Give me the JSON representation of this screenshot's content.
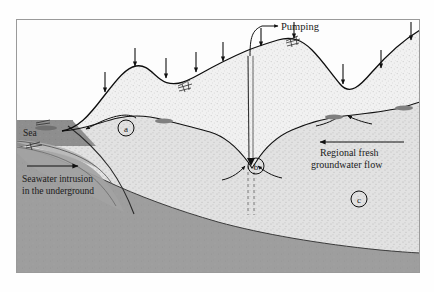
{
  "figure": {
    "title_alt": "Coastal aquifer cross-section showing seawater intrusion, pumping and regional groundwater flow",
    "frame": {
      "x": 16,
      "y": 19,
      "width": 404,
      "height": 254,
      "border_color": "#9a9a9a"
    },
    "background_color": "#fefefe"
  },
  "labels": {
    "sea": "Sea",
    "pumping": "Pumping",
    "regional_flow_line1": "Regional fresh",
    "regional_flow_line2": "groundwater flow",
    "intrusion_line1": "Seawater intrusion",
    "intrusion_line2": "in the underground",
    "callout_a": "a",
    "callout_b": "b",
    "callout_c": "c"
  },
  "colors": {
    "sea_fill": "#8e8e8e",
    "saltwater_wedge": "#a7a7a7",
    "bedrock": "#9e9e9e",
    "aquifer_fill": "#efefef",
    "aquifer_speckle": "#d8d8d8",
    "line_stroke": "#111111",
    "seep_fill": "#7f7f7f",
    "text": "#1a1a1a"
  },
  "icons": {
    "recharge_arrow": "down-arrow-icon",
    "flow_arrow": "left-arrow-icon",
    "intrusion_arrow": "right-arrow-icon",
    "pumping_leader": "curved-leader-arrow-icon",
    "well": "well-icon",
    "seep": "spring-seep-icon"
  },
  "recharge_arrows_x": [
    105,
    135,
    166,
    196,
    223,
    261,
    294,
    343,
    381,
    411
  ],
  "annotations": {
    "arrow_intrusion_x1": 27,
    "arrow_intrusion_x2": 80,
    "arrow_intrusion_y": 166,
    "arrow_flow_x1": 404,
    "arrow_flow_x2": 318,
    "arrow_flow_y": 142
  }
}
